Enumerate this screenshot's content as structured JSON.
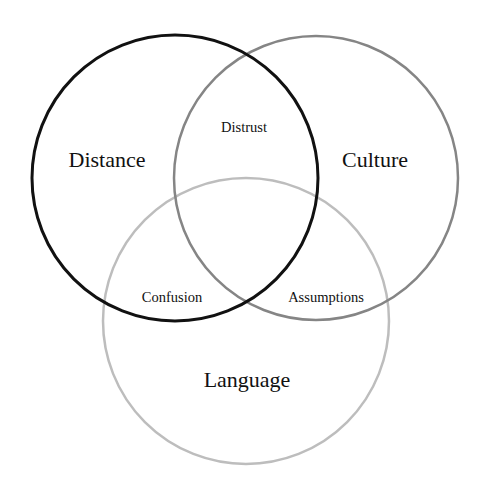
{
  "diagram": {
    "type": "venn",
    "sets": [
      {
        "id": "distance",
        "label": "Distance",
        "color": "#111111",
        "cx": 175,
        "cy": 178,
        "r": 143,
        "stroke_width": 3
      },
      {
        "id": "culture",
        "label": "Culture",
        "color": "#858585",
        "cx": 316,
        "cy": 178,
        "r": 142,
        "stroke_width": 2.5
      },
      {
        "id": "language",
        "label": "Language",
        "color": "#bdbdbd",
        "cx": 246,
        "cy": 321,
        "r": 143,
        "stroke_width": 2.5
      }
    ],
    "intersections": [
      {
        "sets": [
          "distance",
          "culture"
        ],
        "label": "Distrust"
      },
      {
        "sets": [
          "distance",
          "language"
        ],
        "label": "Confusion"
      },
      {
        "sets": [
          "culture",
          "language"
        ],
        "label": "Assumptions"
      }
    ]
  },
  "labels": {
    "distance": "Distance",
    "culture": "Culture",
    "language": "Language",
    "distrust": "Distrust",
    "confusion": "Confusion",
    "assumptions": "Assumptions"
  }
}
